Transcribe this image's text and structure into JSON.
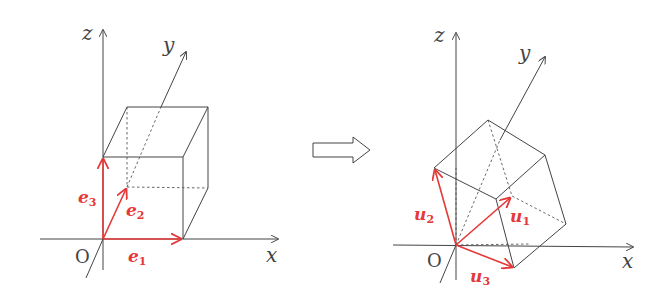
{
  "figure": {
    "colors": {
      "axes": "#444444",
      "vectors": "#e53838",
      "background": "#ffffff"
    },
    "left": {
      "axes": {
        "x": "x",
        "y": "y",
        "z": "z",
        "origin": "O"
      },
      "vectors": [
        {
          "name": "e",
          "sub": "1"
        },
        {
          "name": "e",
          "sub": "2"
        },
        {
          "name": "e",
          "sub": "3"
        }
      ]
    },
    "arrow": "transform-arrow",
    "right": {
      "axes": {
        "x": "x",
        "y": "y",
        "z": "z",
        "origin": "O"
      },
      "vectors": [
        {
          "name": "u",
          "sub": "1"
        },
        {
          "name": "u",
          "sub": "2"
        },
        {
          "name": "u",
          "sub": "3"
        }
      ]
    }
  }
}
